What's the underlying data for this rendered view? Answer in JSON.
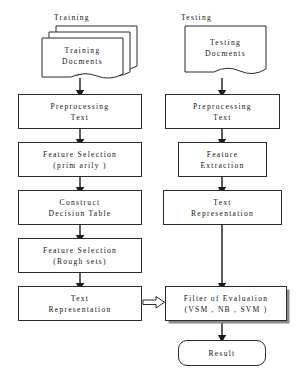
{
  "diagram": {
    "title_labels": {
      "training": "Training",
      "testing": "Testing"
    },
    "left_column": {
      "source": {
        "line1": "Training",
        "line2": "Docments"
      },
      "steps": [
        {
          "id": "preprocessing-text",
          "line1": "Preprocessing",
          "line2": "Text"
        },
        {
          "id": "feature-selection-primarily",
          "line1": "Feature Selection",
          "line2": "(prim arily )"
        },
        {
          "id": "construct-decision-table",
          "line1": "Construct",
          "line2": "Decision Table"
        },
        {
          "id": "feature-selection-rough-sets",
          "line1": "Feature Selection",
          "line2": "(Rough sets)"
        },
        {
          "id": "text-representation-left",
          "line1": "Text",
          "line2": "Representation"
        }
      ]
    },
    "right_column": {
      "source": {
        "line1": "Testing",
        "line2": "Docments"
      },
      "steps": [
        {
          "id": "preprocessing-text-right",
          "line1": "Preprocessing",
          "line2": "Text"
        },
        {
          "id": "feature-extraction",
          "line1": "Feature",
          "line2": "Extraction"
        },
        {
          "id": "text-representation-right",
          "line1": "Text",
          "line2": "Representation"
        }
      ]
    },
    "evaluation": {
      "line1": "Filter of Evaluation",
      "line2": "(VSM , NB , SVM )"
    },
    "result": {
      "label": "Result"
    },
    "colors": {
      "stroke": "#2b2b2b",
      "text": "#141414",
      "background": "#ffffff",
      "shadow": "#8a8a8a",
      "arrow_fill": "#1a1a1a"
    }
  }
}
